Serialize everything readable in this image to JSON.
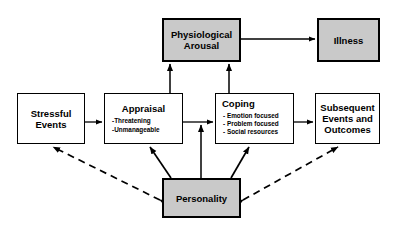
{
  "diagram": {
    "colors": {
      "shaded_fill": "#c9c9c9",
      "node_fill": "#ffffff",
      "stroke": "#000000"
    },
    "nodes": [
      {
        "id": "physiological-arousal",
        "label": "Physiological Arousal",
        "line1": "Physiological",
        "line2": "Arousal",
        "style": "shaded"
      },
      {
        "id": "illness",
        "label": "Illness",
        "line1": "Illness",
        "line2": "",
        "style": "shaded"
      },
      {
        "id": "stressful-events",
        "label": "Stressful Events",
        "line1": "Stressful",
        "line2": "Events",
        "style": "plain"
      },
      {
        "id": "appraisal",
        "label": "Appraisal",
        "line1": "Appraisal",
        "line2": "",
        "style": "plain",
        "bullets": [
          "-Threatening",
          "-Unmanageable"
        ]
      },
      {
        "id": "coping",
        "label": "Coping",
        "line1": "Coping",
        "line2": "",
        "style": "plain",
        "bullets": [
          "- Emotion focused",
          "- Problem focused",
          "- Social resources"
        ]
      },
      {
        "id": "subsequent-events",
        "label": "Subsequent Events and Outcomes",
        "line1": "Subsequent",
        "line2": "Events and",
        "line3": "Outcomes",
        "style": "plain"
      },
      {
        "id": "personality",
        "label": "Personality",
        "line1": "Personality",
        "line2": "",
        "style": "shaded"
      }
    ],
    "edges": [
      {
        "from": "stressful-events",
        "to": "appraisal",
        "kind": "solid",
        "direction": "forward"
      },
      {
        "from": "appraisal",
        "to": "coping",
        "kind": "solid",
        "direction": "forward"
      },
      {
        "from": "coping",
        "to": "subsequent-events",
        "kind": "solid",
        "direction": "forward"
      },
      {
        "from": "appraisal",
        "to": "physiological-arousal",
        "kind": "solid",
        "direction": "forward"
      },
      {
        "from": "coping",
        "to": "physiological-arousal",
        "kind": "solid",
        "direction": "forward"
      },
      {
        "from": "physiological-arousal",
        "to": "illness",
        "kind": "solid",
        "direction": "forward"
      },
      {
        "from": "personality",
        "to": "appraisal",
        "kind": "solid",
        "direction": "forward"
      },
      {
        "from": "personality",
        "to": "coping",
        "kind": "solid",
        "direction": "forward"
      },
      {
        "from": "personality",
        "to": "appraisal-coping-link",
        "kind": "solid",
        "direction": "forward"
      },
      {
        "from": "personality",
        "to": "stressful-events",
        "kind": "dashed",
        "direction": "both"
      },
      {
        "from": "personality",
        "to": "subsequent-events",
        "kind": "dashed",
        "direction": "both"
      }
    ]
  }
}
